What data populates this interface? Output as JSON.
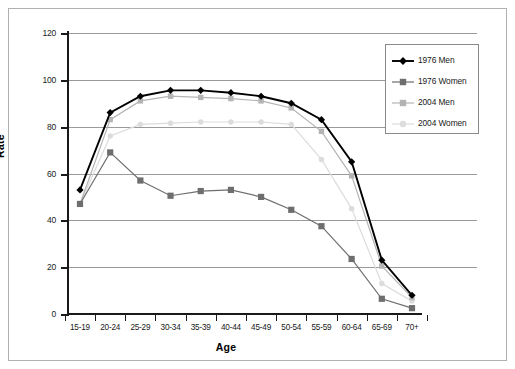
{
  "chart_data": {
    "type": "line",
    "title": "",
    "xlabel": "Age",
    "ylabel": "Rate",
    "ylim": [
      0,
      120
    ],
    "yticks": [
      0,
      20,
      40,
      60,
      80,
      100,
      120
    ],
    "grid": true,
    "legend_position": "top-right",
    "categories": [
      "15-19",
      "20-24",
      "25-29",
      "30-34",
      "35-39",
      "40-44",
      "45-49",
      "50-54",
      "55-59",
      "60-64",
      "65-69",
      "70+"
    ],
    "series": [
      {
        "name": "1976 Men",
        "color": "#000000",
        "marker": "diamond",
        "values": [
          53,
          86,
          93,
          95.5,
          95.5,
          94.5,
          93,
          90,
          83,
          65,
          23,
          8
        ]
      },
      {
        "name": "1976 Women",
        "color": "#6e6e6e",
        "marker": "square",
        "values": [
          47,
          69,
          57,
          50.5,
          52.5,
          53,
          50,
          44.5,
          37.5,
          23.5,
          6.5,
          2.5
        ]
      },
      {
        "name": "2004 Men",
        "color": "#b4b4b4",
        "marker": "square",
        "values": [
          47,
          83,
          91,
          93,
          92.5,
          92,
          91,
          88,
          78,
          59,
          20.5,
          7
        ]
      },
      {
        "name": "2004 Women",
        "color": "#dcdcdc",
        "marker": "circle",
        "values": [
          47,
          76,
          81,
          81.5,
          82,
          82,
          82,
          81,
          66,
          45,
          13,
          5.5
        ]
      }
    ]
  },
  "legend": {
    "entries": [
      {
        "label": "1976 Men"
      },
      {
        "label": "1976 Women"
      },
      {
        "label": "2004 Men"
      },
      {
        "label": "2004 Women"
      }
    ]
  },
  "axes": {
    "y_title": "Rate",
    "x_title": "Age",
    "y_tick_labels": [
      "120",
      "100",
      "80",
      "60",
      "40",
      "20",
      "0"
    ],
    "x_tick_labels": [
      "15-19",
      "20-24",
      "25-29",
      "30-34",
      "35-39",
      "40-44",
      "45-49",
      "50-54",
      "55-59",
      "60-64",
      "65-69",
      "70+"
    ]
  }
}
